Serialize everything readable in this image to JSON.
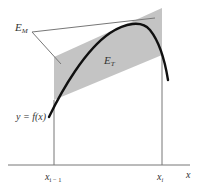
{
  "diagram": {
    "labels": {
      "em": {
        "main": "E",
        "sub": "M"
      },
      "et": {
        "main": "E",
        "sub": "T"
      },
      "curve": "y = f(x)",
      "x_left": {
        "main": "x",
        "sub": "i − 1"
      },
      "x_right": {
        "main": "x",
        "sub": "i"
      },
      "axis": "x"
    },
    "colors": {
      "band_fill": "#c4c4c4",
      "curve": "#111111",
      "lines": "#777777",
      "text": "#333333"
    }
  }
}
